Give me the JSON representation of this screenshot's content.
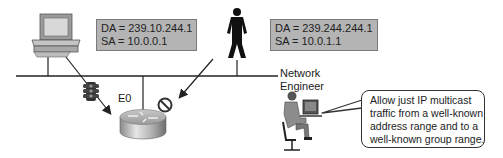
{
  "diagram": {
    "packets": [
      {
        "id": "allowed",
        "da": "DA = 239.10.244.1",
        "sa": "SA = 10.0.0.1"
      },
      {
        "id": "blocked",
        "da": "DA = 239.244.244.1",
        "sa": "SA = 10.0.1.1"
      }
    ],
    "interface_label": "E0",
    "engineer_label_line1": "Network",
    "engineer_label_line2": "Engineer",
    "callout": {
      "lines": [
        "Allow just IP multicast",
        "traffic from a well-known",
        "address range and to a",
        "well-known group range."
      ]
    },
    "nodes": [
      "workstation",
      "user",
      "router",
      "traffic-light-filter",
      "blocked-symbol",
      "network-engineer"
    ],
    "colors": {
      "packet_box_bg": "#b4b4b4",
      "line": "#222222"
    }
  }
}
